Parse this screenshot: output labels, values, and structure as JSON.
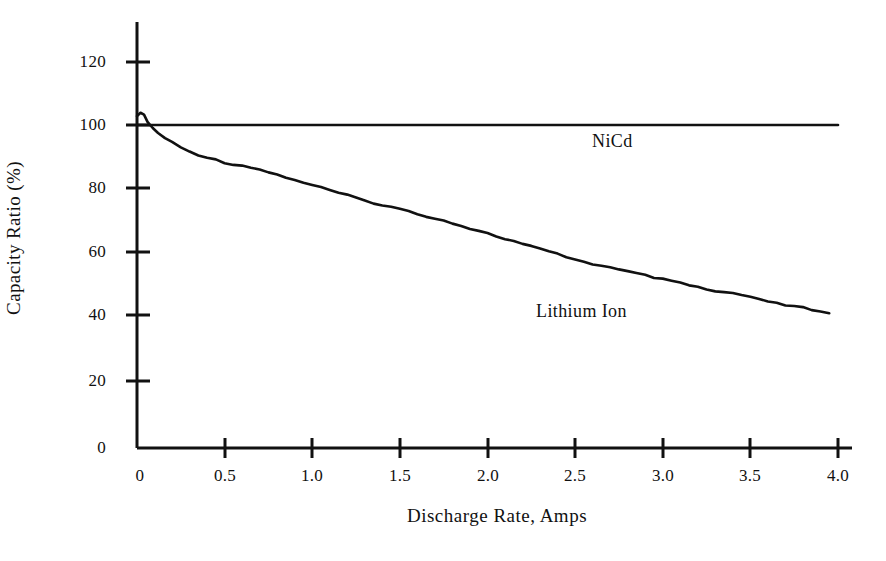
{
  "chart_data": {
    "type": "line",
    "title": "",
    "xlabel": "Discharge Rate, Amps",
    "ylabel": "Capacity Ratio (%)",
    "xlim": [
      0,
      4.0
    ],
    "ylim": [
      0,
      130
    ],
    "grid": false,
    "legend_position": "inline-annotations",
    "xticks": [
      "0",
      "0.5",
      "1.0",
      "1.5",
      "2.0",
      "2.5",
      "3.0",
      "3.5",
      "4.0"
    ],
    "xtick_values": [
      0,
      0.5,
      1.0,
      1.5,
      2.0,
      2.5,
      3.0,
      3.5,
      4.0
    ],
    "yticks": [
      "0",
      "20",
      "40",
      "60",
      "80",
      "100",
      "120"
    ],
    "ytick_values": [
      0,
      20,
      40,
      60,
      80,
      100,
      120
    ],
    "series": [
      {
        "name": "NiCd",
        "annotation": "NiCd",
        "x": [
          0,
          4.0
        ],
        "values": [
          100,
          100
        ]
      },
      {
        "name": "Lithium Ion",
        "annotation": "Lithium  Ion",
        "x": [
          0.0,
          0.02,
          0.04,
          0.06,
          0.09,
          0.12,
          0.16,
          0.2,
          0.25,
          0.3,
          0.35,
          0.4,
          0.45,
          0.5,
          0.55,
          0.6,
          0.65,
          0.7,
          0.75,
          0.8,
          0.85,
          0.9,
          0.95,
          1.0,
          1.05,
          1.1,
          1.15,
          1.2,
          1.25,
          1.3,
          1.35,
          1.4,
          1.45,
          1.5,
          1.55,
          1.6,
          1.65,
          1.7,
          1.75,
          1.8,
          1.85,
          1.9,
          1.95,
          2.0,
          2.05,
          2.1,
          2.15,
          2.2,
          2.25,
          2.3,
          2.35,
          2.4,
          2.45,
          2.5,
          2.55,
          2.6,
          2.65,
          2.7,
          2.75,
          2.8,
          2.85,
          2.9,
          2.95,
          3.0,
          3.05,
          3.1,
          3.15,
          3.2,
          3.25,
          3.3,
          3.35,
          3.4,
          3.45,
          3.5,
          3.55,
          3.6,
          3.65,
          3.7,
          3.75,
          3.8,
          3.85,
          3.9,
          3.95
        ],
        "values": [
          102.5,
          104.0,
          103.0,
          101.0,
          99.0,
          97.5,
          96.0,
          94.6,
          93.0,
          91.8,
          90.8,
          90.0,
          89.2,
          88.4,
          87.8,
          87.4,
          87.0,
          86.2,
          85.4,
          84.6,
          83.8,
          83.0,
          82.2,
          81.4,
          80.6,
          79.8,
          79.0,
          78.2,
          77.4,
          76.6,
          75.9,
          75.2,
          74.6,
          74.0,
          73.2,
          72.4,
          71.8,
          71.2,
          70.4,
          69.6,
          68.8,
          68.0,
          67.2,
          66.4,
          65.6,
          64.8,
          64.0,
          63.2,
          62.4,
          61.6,
          60.8,
          60.0,
          59.2,
          58.4,
          57.6,
          57.0,
          56.4,
          55.8,
          55.2,
          54.6,
          54.0,
          53.4,
          52.8,
          52.2,
          51.6,
          51.0,
          50.4,
          49.8,
          49.0,
          48.4,
          48.2,
          48.0,
          47.2,
          46.6,
          46.0,
          45.4,
          44.8,
          44.2,
          43.8,
          43.4,
          42.8,
          42.2,
          41.5
        ]
      }
    ]
  },
  "axes": {
    "x_axis_name": "discharge-rate-axis",
    "y_axis_name": "capacity-ratio-axis"
  }
}
